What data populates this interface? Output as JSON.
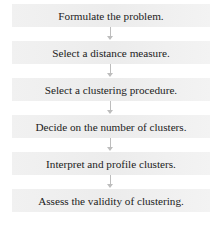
{
  "diagram": {
    "type": "flowchart",
    "direction": "top-to-bottom",
    "steps": [
      {
        "label": "Formulate the problem."
      },
      {
        "label": "Select a distance measure."
      },
      {
        "label": "Select a clustering procedure."
      },
      {
        "label": "Decide on the number of clusters."
      },
      {
        "label": "Interpret and profile clusters."
      },
      {
        "label": "Assess the validity of clustering."
      }
    ],
    "colors": {
      "box_fill": "#eeeeee",
      "arrow": "#bdbdbd",
      "text": "#222222"
    }
  }
}
